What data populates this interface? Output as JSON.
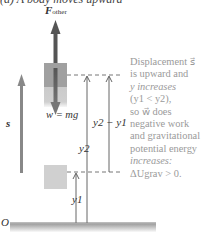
{
  "figure": {
    "title": "(a) A body moves upward",
    "force_label": {
      "symbol": "F",
      "subscript": "other"
    },
    "weight_label": "w = mg",
    "displacement_label": "s",
    "y2_minus_y1_label": "y2 − y1",
    "y2_label": "y2",
    "y1_label": "y1",
    "origin_label": "O",
    "description": [
      {
        "text": "Displacement ",
        "italic": false
      },
      {
        "text": "s",
        "italic": true
      },
      {
        "text": " is upward and ",
        "italic": false
      },
      {
        "text": "y increases",
        "italic": true
      },
      {
        "text": " (y1 < y2),",
        "italic": false
      },
      {
        "text": " so w does ",
        "italic": false
      },
      {
        "text": "negative",
        "italic": true
      },
      {
        "text": " work and gravitational potential energy ",
        "italic": false
      },
      {
        "text": "increases:",
        "italic": true
      },
      {
        "text": " ΔUgrav > 0.",
        "italic": false
      }
    ],
    "description_lines": [
      "Displacement s⃗",
      "is upward and",
      "y increases",
      "(y1 < y2),",
      "so w⃗ does",
      "negative work",
      "and gravitational",
      "potential energy",
      "increases:",
      "ΔUgrav > 0."
    ]
  },
  "colors": {
    "upper_block": "#a0a0a0",
    "lower_block": "#d0d0d0",
    "force_arrow": "#555555",
    "text_gray": "#9a9a9a",
    "ground": "#888888"
  }
}
